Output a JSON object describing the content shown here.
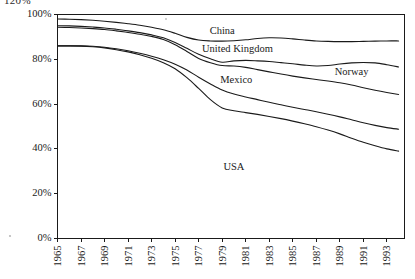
{
  "page": {
    "clipped_header_text": "120%"
  },
  "chart_data": {
    "type": "line",
    "title": "",
    "subtitle": "",
    "xlabel": "",
    "ylabel": "",
    "xlim": [
      1965,
      1994.5
    ],
    "ylim": [
      0,
      100
    ],
    "grid": false,
    "legend_position": "inline-labels",
    "y_tick_labels": [
      "0%",
      "20%",
      "40%",
      "60%",
      "80%",
      "100%"
    ],
    "y_tick_values": [
      0,
      20,
      40,
      60,
      80,
      100
    ],
    "x_tick_labels": [
      "1965",
      "1967",
      "1969",
      "1971",
      "1973",
      "1975",
      "1977",
      "1979",
      "1981",
      "1983",
      "1985",
      "1987",
      "1989",
      "1991",
      "1993"
    ],
    "x_tick_values": [
      1965,
      1967,
      1969,
      1971,
      1973,
      1975,
      1977,
      1979,
      1981,
      1983,
      1985,
      1987,
      1989,
      1991,
      1993
    ],
    "x": [
      1965,
      1966,
      1967,
      1968,
      1969,
      1970,
      1971,
      1972,
      1973,
      1974,
      1975,
      1976,
      1977,
      1978,
      1979,
      1980,
      1981,
      1982,
      1983,
      1984,
      1985,
      1986,
      1987,
      1988,
      1989,
      1990,
      1991,
      1992,
      1993,
      1994
    ],
    "series": [
      {
        "name": "China",
        "label": "China",
        "label_x": 1979.0,
        "label_y": 93.0,
        "values": [
          98.0,
          97.9,
          97.7,
          97.4,
          97.0,
          96.5,
          95.9,
          95.2,
          94.3,
          93.2,
          91.6,
          89.8,
          88.6,
          88.2,
          88.1,
          88.3,
          88.7,
          89.3,
          89.6,
          89.5,
          89.1,
          88.6,
          88.2,
          88.0,
          87.9,
          87.9,
          88.0,
          88.1,
          88.2,
          88.2
        ]
      },
      {
        "name": "United Kingdom",
        "label": "United Kingdom",
        "label_x": 1980.3,
        "label_y": 85.0,
        "values": [
          95.0,
          94.9,
          94.7,
          94.4,
          94.0,
          93.4,
          92.7,
          91.9,
          90.9,
          89.6,
          87.5,
          84.9,
          82.2,
          80.2,
          78.7,
          79.3,
          79.5,
          79.3,
          79.0,
          78.5,
          78.0,
          77.4,
          77.0,
          77.2,
          77.9,
          78.4,
          78.6,
          78.4,
          77.6,
          76.6
        ]
      },
      {
        "name": "Norway",
        "label": "Norway",
        "label_x": 1990.0,
        "label_y": 74.5,
        "values": [
          94.3,
          94.2,
          94.0,
          93.7,
          93.3,
          92.7,
          92.0,
          91.2,
          90.2,
          88.8,
          86.5,
          83.5,
          80.4,
          78.5,
          77.2,
          77.0,
          76.4,
          75.4,
          74.4,
          73.4,
          72.5,
          71.7,
          71.0,
          70.3,
          69.5,
          68.5,
          67.3,
          66.2,
          65.2,
          64.3
        ]
      },
      {
        "name": "Mexico",
        "label": "Mexico",
        "label_x": 1980.2,
        "label_y": 71.0,
        "values": [
          86.0,
          86.0,
          86.0,
          85.8,
          85.4,
          84.7,
          83.8,
          82.7,
          81.4,
          79.8,
          77.8,
          75.2,
          72.0,
          69.0,
          66.3,
          64.5,
          63.2,
          62.0,
          60.8,
          59.7,
          58.6,
          57.6,
          56.6,
          55.5,
          54.3,
          53.0,
          51.7,
          50.5,
          49.5,
          48.8
        ]
      },
      {
        "name": "USA",
        "label": "USA",
        "label_x": 1980.0,
        "label_y": 32.0,
        "values": [
          86.0,
          86.0,
          85.9,
          85.6,
          85.1,
          84.3,
          83.3,
          82.0,
          80.5,
          78.5,
          75.8,
          71.8,
          67.0,
          62.0,
          58.3,
          57.0,
          56.2,
          55.4,
          54.5,
          53.5,
          52.4,
          51.2,
          49.9,
          48.4,
          46.7,
          44.8,
          43.0,
          41.4,
          40.0,
          39.0
        ]
      }
    ]
  },
  "colors": {
    "line": "#1a1a1a",
    "axis": "#1a1a1a",
    "background": "#ffffff"
  }
}
